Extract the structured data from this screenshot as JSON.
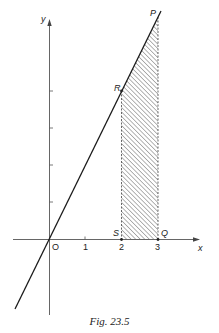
{
  "figure": {
    "caption": "Fig. 23.5",
    "axes": {
      "x_label": "x",
      "y_label": "y",
      "origin_label": "O",
      "x_tick_labels": [
        "1",
        "2",
        "3"
      ]
    },
    "points": {
      "P": "P",
      "R": "R",
      "S": "S",
      "Q": "Q"
    },
    "line": {
      "equation": "y = 2x",
      "description": "straight line through origin O, R(2,4) and P(3,6)"
    },
    "shaded_region": {
      "description": "trapezium PRSQ under line between x = 2 and x = 3",
      "x_from": 2,
      "x_to": 3,
      "pattern": "diagonal hatching"
    },
    "colors": {
      "ink": "#222222",
      "axis": "#555555",
      "hatch": "#666666",
      "background": "#ffffff"
    }
  }
}
